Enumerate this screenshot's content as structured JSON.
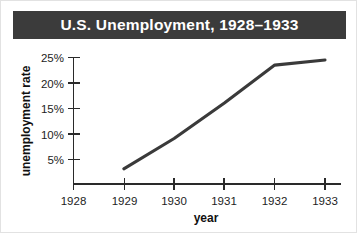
{
  "title": {
    "text": "U.S. Unemployment, 1928–1933",
    "bar_color": "#3b3b3b",
    "text_color": "#ffffff"
  },
  "chart_data": {
    "type": "line",
    "title": "U.S. Unemployment, 1928–1933",
    "xlabel": "year",
    "ylabel": "unemployment rate",
    "x": [
      1929,
      1930,
      1931,
      1932,
      1933
    ],
    "values": [
      3,
      9,
      16,
      23.5,
      24.5
    ],
    "series": [
      {
        "name": "unemployment rate",
        "x": [
          1929,
          1930,
          1931,
          1932,
          1933
        ],
        "values": [
          3,
          9,
          16,
          23.5,
          24.5
        ],
        "color": "#3a3a3a"
      }
    ],
    "x_ticks": [
      1928,
      1929,
      1930,
      1931,
      1932,
      1933
    ],
    "x_tick_labels": [
      "1928",
      "1929",
      "1930",
      "1931",
      "1932",
      "1933"
    ],
    "y_ticks": [
      5,
      10,
      15,
      20,
      25
    ],
    "y_tick_labels": [
      "5%",
      "10%",
      "15%",
      "20%",
      "25%"
    ],
    "xlim": [
      1928,
      1933
    ],
    "ylim": [
      0,
      25
    ],
    "grid": false,
    "legend": false,
    "line_color": "#3a3a3a"
  },
  "axes": {
    "y_label": "unemployment rate",
    "x_label": "year",
    "y_tick_labels": [
      "25%",
      "20%",
      "15%",
      "10%",
      "5%"
    ],
    "x_tick_labels": [
      "1928",
      "1929",
      "1930",
      "1931",
      "1932",
      "1933"
    ]
  }
}
